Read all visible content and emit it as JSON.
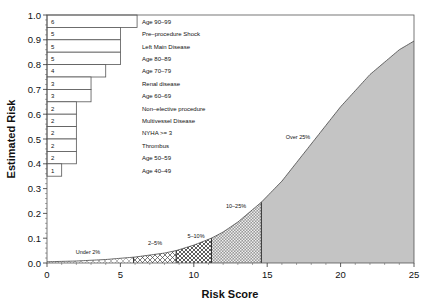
{
  "chart_data": {
    "type": "area",
    "title": "",
    "xlabel": "Risk Score",
    "ylabel": "Estimated Risk",
    "xlim": [
      0,
      25
    ],
    "ylim": [
      0,
      1.0
    ],
    "x_ticks": [
      0,
      5,
      10,
      15,
      20,
      25
    ],
    "y_ticks": [
      0.0,
      0.1,
      0.2,
      0.3,
      0.4,
      0.5,
      0.6,
      0.7,
      0.8,
      0.9,
      1.0
    ],
    "y_tick_labels": [
      "0.0",
      "0.1",
      "0.2",
      "0.3",
      "0.4",
      "0.5",
      "0.6",
      "0.7",
      "0.8",
      "0.9",
      "1.0"
    ],
    "grid": false,
    "curve": {
      "name": "Estimated Risk vs Risk Score",
      "x": [
        0,
        2,
        4,
        6,
        8,
        8.8,
        10,
        11.2,
        12,
        13,
        14,
        14.6,
        16,
        18,
        20,
        22,
        24,
        25
      ],
      "y": [
        0.005,
        0.008,
        0.014,
        0.024,
        0.04,
        0.05,
        0.072,
        0.1,
        0.125,
        0.165,
        0.215,
        0.245,
        0.33,
        0.48,
        0.63,
        0.76,
        0.86,
        0.895
      ]
    },
    "regions": [
      {
        "label": "Under 2%",
        "x_start": 0,
        "x_end": 5.9,
        "pattern": "light-cross"
      },
      {
        "label": "2–5%",
        "x_start": 5.9,
        "x_end": 8.8,
        "pattern": "crosshatch"
      },
      {
        "label": "5–10%",
        "x_start": 8.8,
        "x_end": 11.2,
        "pattern": "dense-crosshatch"
      },
      {
        "label": "10–25%",
        "x_start": 11.2,
        "x_end": 14.6,
        "pattern": "dense-dots"
      },
      {
        "label": "Over 25%",
        "x_start": 14.6,
        "x_end": 25,
        "pattern": "solid-gray"
      }
    ],
    "risk_factor_bars": [
      {
        "factor": "Age 90–99",
        "points": 6
      },
      {
        "factor": "Pre–procedure Shock",
        "points": 5
      },
      {
        "factor": "Left Main Disease",
        "points": 5
      },
      {
        "factor": "Age 80–89",
        "points": 5
      },
      {
        "factor": "Age 70–79",
        "points": 4
      },
      {
        "factor": "Renal disease",
        "points": 3
      },
      {
        "factor": "Age 60–69",
        "points": 3
      },
      {
        "factor": "Non–elective procedure",
        "points": 2
      },
      {
        "factor": "Multivessel Disease",
        "points": 2
      },
      {
        "factor": "NYHA >= 3",
        "points": 2
      },
      {
        "factor": "Thrombus",
        "points": 2
      },
      {
        "factor": "Age 50–59",
        "points": 2
      },
      {
        "factor": "Age 40–49",
        "points": 1
      }
    ]
  },
  "labels": {
    "xlabel": "Risk Score",
    "ylabel": "Estimated Risk",
    "region_under2": "Under 2%",
    "region_2_5": "2–5%",
    "region_5_10": "5–10%",
    "region_10_25": "10–25%",
    "region_over25": "Over 25%"
  },
  "colors": {
    "fill_gray": "#c4c4c4",
    "line": "#333333",
    "text": "#111111"
  }
}
